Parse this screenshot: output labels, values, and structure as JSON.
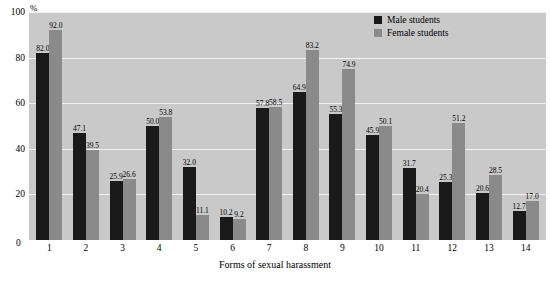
{
  "chart_data": {
    "type": "bar",
    "title": "",
    "xlabel": "Forms of sexual harassment",
    "ylabel": "%",
    "ylim": [
      0,
      100
    ],
    "yticks": [
      0,
      20,
      40,
      60,
      80,
      100
    ],
    "grid": true,
    "legend_position": "top-right",
    "categories": [
      "1",
      "2",
      "3",
      "4",
      "5",
      "6",
      "7",
      "8",
      "9",
      "10",
      "11",
      "12",
      "13",
      "14"
    ],
    "series": [
      {
        "name": "Male students",
        "color": "#1a1a1a",
        "values": [
          82.0,
          47.1,
          25.9,
          50.0,
          32.0,
          10.2,
          57.8,
          64.9,
          55.3,
          45.9,
          31.7,
          25.3,
          20.6,
          12.7
        ]
      },
      {
        "name": "Female students",
        "color": "#8a8a8a",
        "values": [
          92.0,
          39.5,
          26.6,
          53.8,
          11.1,
          9.2,
          58.5,
          83.2,
          74.9,
          50.1,
          20.4,
          51.2,
          28.5,
          17.0
        ]
      }
    ]
  },
  "axis": {
    "y_unit": "%",
    "y_ticks": [
      "100",
      "80",
      "60",
      "40",
      "20"
    ],
    "x_zero": "0",
    "x_title": "Forms of sexual harassment"
  },
  "legend": {
    "items": [
      {
        "label": "Male students"
      },
      {
        "label": "Female students"
      }
    ]
  }
}
